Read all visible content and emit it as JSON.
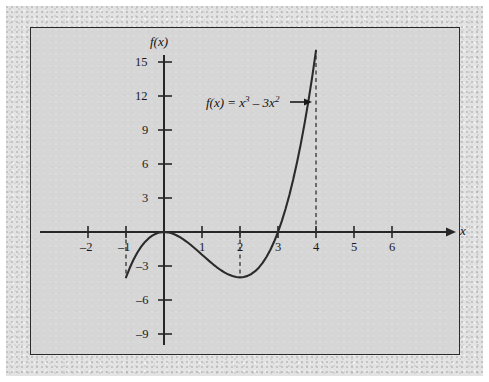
{
  "figure": {
    "background_color": "#d6d6d6",
    "mat_color": "#e3e3e3",
    "frame_color": "#2a2a2a",
    "curve_color": "#2b2b2b"
  },
  "labels": {
    "y_axis_name": "f(x)",
    "x_axis_name": "x",
    "annotation_prefix": "f(x) = x",
    "annotation_exp1": "3",
    "annotation_middle": " – 3x",
    "annotation_exp2": "2",
    "annotation_arrow": "→",
    "annotation_full": "f(x) = x3 – 3x2"
  },
  "chart_data": {
    "type": "line",
    "title": "",
    "xlabel": "x",
    "ylabel": "f(x)",
    "equation": "f(x) = x^3 - 3x^2",
    "xlim": [
      -2.9,
      7.0
    ],
    "ylim": [
      -10.5,
      17.5
    ],
    "grid": false,
    "legend": "none",
    "x_ticks": [
      -2,
      -1,
      1,
      2,
      3,
      4,
      5,
      6
    ],
    "x_tick_labels": [
      "–2",
      "–1",
      "1",
      "2",
      "3",
      "4",
      "5",
      "6"
    ],
    "y_ticks": [
      15,
      12,
      9,
      6,
      3,
      -3,
      -6,
      -9
    ],
    "y_tick_labels": [
      "15",
      "12",
      "9",
      "6",
      "3",
      "–3",
      "–6",
      "–9"
    ],
    "domain_plotted": [
      -1,
      4
    ],
    "series": [
      {
        "name": "f(x) = x^3 - 3x^2",
        "x": [
          -1,
          -0.9,
          -0.8,
          -0.7,
          -0.6,
          -0.5,
          -0.4,
          -0.3,
          -0.2,
          -0.1,
          0,
          0.1,
          0.2,
          0.3,
          0.4,
          0.5,
          0.6,
          0.7,
          0.8,
          0.9,
          1,
          1.1,
          1.2,
          1.3,
          1.4,
          1.5,
          1.6,
          1.7,
          1.8,
          1.9,
          2,
          2.1,
          2.2,
          2.3,
          2.4,
          2.5,
          2.6,
          2.7,
          2.8,
          2.9,
          3,
          3.1,
          3.2,
          3.3,
          3.4,
          3.5,
          3.6,
          3.7,
          3.8,
          3.9,
          4
        ],
        "y": [
          -4,
          -3.159,
          -2.432,
          -1.813,
          -1.296,
          -0.875,
          -0.544,
          -0.297,
          -0.128,
          -0.031,
          0,
          -0.029,
          -0.112,
          -0.243,
          -0.416,
          -0.625,
          -0.864,
          -1.127,
          -1.408,
          -1.701,
          -2,
          -2.299,
          -2.592,
          -2.873,
          -3.136,
          -3.375,
          -3.584,
          -3.757,
          -3.888,
          -3.971,
          -4,
          -3.969,
          -3.872,
          -3.703,
          -3.456,
          -3.125,
          -2.704,
          -2.187,
          -1.568,
          -0.841,
          0,
          0.961,
          2.048,
          3.267,
          4.624,
          6.125,
          7.776,
          9.583,
          11.552,
          13.689,
          16
        ]
      }
    ],
    "key_points": [
      {
        "label": "left endpoint",
        "x": -1,
        "y": -4
      },
      {
        "label": "local maximum / root",
        "x": 0,
        "y": 0
      },
      {
        "label": "local minimum",
        "x": 2,
        "y": -4
      },
      {
        "label": "root",
        "x": 3,
        "y": 0
      },
      {
        "label": "right endpoint",
        "x": 4,
        "y": 16
      }
    ],
    "dashed_guides": [
      {
        "x": -1,
        "from_y": 0,
        "to_y": -4
      },
      {
        "x": 2,
        "from_y": 0,
        "to_y": -4
      },
      {
        "x": 4,
        "from_y": 0,
        "to_y": 16
      }
    ],
    "annotations": [
      {
        "text": "f(x) = x3 – 3x2",
        "x": 1.1,
        "y": 11.5,
        "arrow_to": [
          3.55,
          11.5
        ]
      }
    ]
  }
}
